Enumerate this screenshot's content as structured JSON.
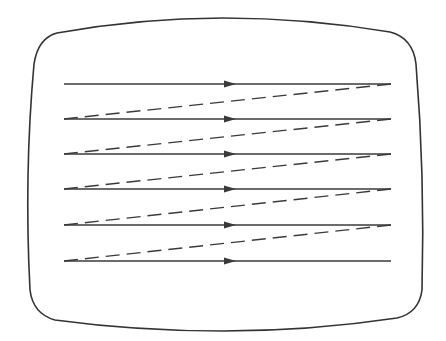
{
  "diagram": {
    "title": "",
    "type": "raster-scan",
    "colors": {
      "background": "#ffffff",
      "stroke": "#3a3a3a",
      "frame": "#333333"
    },
    "frame": {
      "shape": "rounded-tv-screen",
      "left": 25,
      "right": 425,
      "top_center": 18,
      "bottom_center": 331
    },
    "scan_lines": [
      {
        "index": 1,
        "y": 84,
        "x_start": 64,
        "x_end": 391,
        "arrow_x": 230
      },
      {
        "index": 2,
        "y": 119,
        "x_start": 64,
        "x_end": 391,
        "arrow_x": 230
      },
      {
        "index": 3,
        "y": 154,
        "x_start": 64,
        "x_end": 391,
        "arrow_x": 230
      },
      {
        "index": 4,
        "y": 189,
        "x_start": 64,
        "x_end": 391,
        "arrow_x": 230
      },
      {
        "index": 5,
        "y": 225,
        "x_start": 64,
        "x_end": 391,
        "arrow_x": 230
      },
      {
        "index": 6,
        "y": 261,
        "x_start": 64,
        "x_end": 391,
        "arrow_x": 230
      }
    ],
    "retrace_lines": [
      {
        "from": [
          391,
          84
        ],
        "to": [
          64,
          119
        ],
        "style": "dashed"
      },
      {
        "from": [
          391,
          119
        ],
        "to": [
          64,
          154
        ],
        "style": "dashed"
      },
      {
        "from": [
          391,
          154
        ],
        "to": [
          64,
          189
        ],
        "style": "dashed"
      },
      {
        "from": [
          391,
          189
        ],
        "to": [
          64,
          225
        ],
        "style": "dashed"
      },
      {
        "from": [
          391,
          225
        ],
        "to": [
          64,
          261
        ],
        "style": "dashed"
      }
    ],
    "labels": []
  }
}
